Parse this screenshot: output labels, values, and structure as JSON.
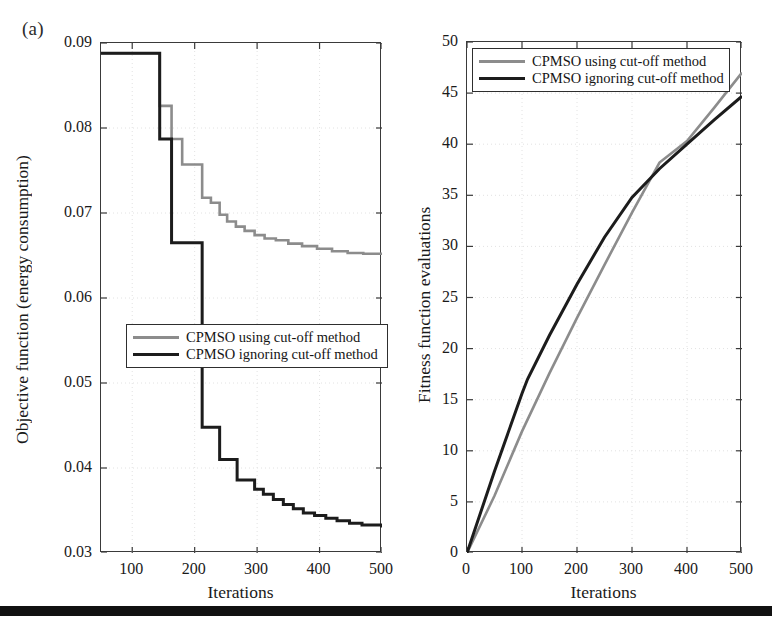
{
  "figure": {
    "panel_tag": "(a)",
    "bottom_rule": true
  },
  "colors": {
    "series_using_cutoff": "#8c8c8c",
    "series_ignoring_cutoff": "#1c1c1c",
    "axis": "#3a3a3a",
    "grid": "#e2e2e2",
    "background": "#ffffff"
  },
  "legend": {
    "using_label": "CPMSO using cut-off method",
    "ignoring_label": "CPMSO ignoring cut-off method"
  },
  "chart_data": [
    {
      "id": "left",
      "type": "line",
      "title": "",
      "xlabel": "Iterations",
      "ylabel": "Objective function (energy consumption)",
      "xlim": [
        50,
        500
      ],
      "ylim": [
        0.03,
        0.09
      ],
      "xticks": [
        100,
        200,
        300,
        400,
        500
      ],
      "yticks": [
        0.03,
        0.04,
        0.05,
        0.06,
        0.07,
        0.08,
        0.09
      ],
      "ytick_labels": [
        "0.03",
        "0.04",
        "0.05",
        "0.06",
        "0.07",
        "0.08",
        "0.09"
      ],
      "xtick_labels": [
        "100",
        "200",
        "300",
        "400",
        "500"
      ],
      "grid": true,
      "step": true,
      "legend_position": "center-left",
      "series": [
        {
          "name": "CPMSO using cut-off method",
          "color": "#8c8c8c",
          "x": [
            50,
            144,
            163,
            180,
            196,
            212,
            226,
            240,
            252,
            266,
            280,
            296,
            312,
            330,
            350,
            372,
            396,
            420,
            445,
            470,
            500
          ],
          "values": [
            0.0888,
            0.0826,
            0.0787,
            0.0757,
            0.0757,
            0.0718,
            0.0712,
            0.0698,
            0.069,
            0.0684,
            0.0679,
            0.0674,
            0.067,
            0.0668,
            0.0664,
            0.0661,
            0.0658,
            0.0655,
            0.0653,
            0.0652,
            0.0652
          ]
        },
        {
          "name": "CPMSO ignoring cut-off method",
          "color": "#1c1c1c",
          "x": [
            50,
            144,
            163,
            180,
            212,
            228,
            240,
            255,
            268,
            282,
            296,
            310,
            326,
            342,
            358,
            374,
            392,
            410,
            428,
            448,
            468,
            500
          ],
          "values": [
            0.0888,
            0.0787,
            0.0665,
            0.0665,
            0.0448,
            0.0448,
            0.041,
            0.041,
            0.0386,
            0.0386,
            0.0375,
            0.0369,
            0.0363,
            0.0357,
            0.0352,
            0.0347,
            0.0344,
            0.0341,
            0.0338,
            0.0335,
            0.0333,
            0.033
          ]
        }
      ]
    },
    {
      "id": "right",
      "type": "line",
      "title": "",
      "xlabel": "Iterations",
      "ylabel": "Fitness function evaluations",
      "xlim": [
        0,
        500
      ],
      "ylim": [
        0,
        50
      ],
      "xticks": [
        0,
        100,
        200,
        300,
        400,
        500
      ],
      "yticks": [
        0,
        5,
        10,
        15,
        20,
        25,
        30,
        35,
        40,
        45,
        50
      ],
      "ytick_labels": [
        "0",
        "5",
        "10",
        "15",
        "20",
        "25",
        "30",
        "35",
        "40",
        "45",
        "50"
      ],
      "xtick_labels": [
        "0",
        "100",
        "200",
        "300",
        "400",
        "500"
      ],
      "grid": true,
      "step": false,
      "legend_position": "top-left",
      "series": [
        {
          "name": "CPMSO using cut-off method",
          "color": "#8c8c8c",
          "x": [
            0,
            50,
            100,
            150,
            200,
            250,
            300,
            350,
            400,
            450,
            500
          ],
          "values": [
            0.0,
            5.6,
            11.9,
            17.6,
            23.0,
            28.2,
            33.3,
            38.2,
            40.3,
            43.6,
            47.0
          ]
        },
        {
          "name": "CPMSO ignoring cut-off method",
          "color": "#1c1c1c",
          "x": [
            0,
            50,
            100,
            110,
            150,
            200,
            250,
            300,
            350,
            400,
            450,
            500
          ],
          "values": [
            0.0,
            8.0,
            15.6,
            17.0,
            21.3,
            26.3,
            30.9,
            34.8,
            37.6,
            40.0,
            42.4,
            44.7
          ]
        }
      ]
    }
  ]
}
